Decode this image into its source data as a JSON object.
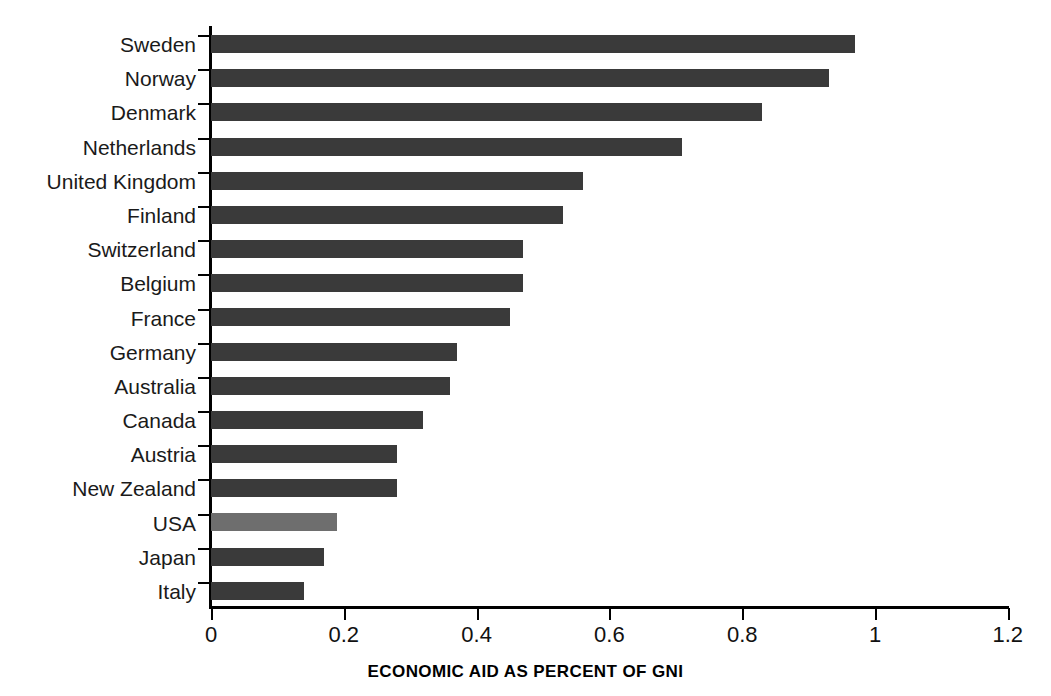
{
  "chart_data": {
    "type": "bar",
    "orientation": "horizontal",
    "title": "",
    "xlabel": "ECONOMIC AID AS PERCENT OF GNI",
    "ylabel": "",
    "xlim": [
      0,
      1.2
    ],
    "xticks": [
      "0",
      "0.2",
      "0.4",
      "0.6",
      "0.8",
      "1",
      "1.2"
    ],
    "xtick_values": [
      0,
      0.2,
      0.4,
      0.6,
      0.8,
      1,
      1.2
    ],
    "grid": false,
    "legend": "none",
    "categories": [
      "Sweden",
      "Norway",
      "Denmark",
      "Netherlands",
      "United Kingdom",
      "Finland",
      "Switzerland",
      "Belgium",
      "France",
      "Germany",
      "Australia",
      "Canada",
      "Austria",
      "New Zealand",
      "USA",
      "Japan",
      "Italy"
    ],
    "values": [
      0.97,
      0.93,
      0.83,
      0.71,
      0.56,
      0.53,
      0.47,
      0.47,
      0.45,
      0.37,
      0.36,
      0.32,
      0.28,
      0.28,
      0.19,
      0.17,
      0.14
    ],
    "highlight_category": "USA",
    "colors": {
      "bar": "#3a3a3a",
      "bar_highlight": "#6e6e6e",
      "axis": "#000000",
      "background": "#ffffff"
    }
  }
}
